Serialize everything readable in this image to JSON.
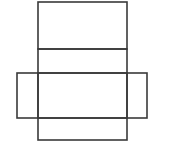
{
  "diagram": {
    "type": "net-of-cuboid",
    "stroke_color": "#3a3a3a",
    "background": "#ffffff",
    "stroke_width": 1.6,
    "faces": [
      {
        "name": "top-face",
        "x": 38,
        "y": 2,
        "w": 89,
        "h": 47
      },
      {
        "name": "back-face",
        "x": 38,
        "y": 49,
        "w": 89,
        "h": 24
      },
      {
        "name": "bottom-face",
        "x": 38,
        "y": 73,
        "w": 89,
        "h": 45
      },
      {
        "name": "front-face",
        "x": 38,
        "y": 118,
        "w": 89,
        "h": 22
      },
      {
        "name": "left-face",
        "x": 17,
        "y": 73,
        "w": 21,
        "h": 45
      },
      {
        "name": "right-face",
        "x": 127,
        "y": 73,
        "w": 20,
        "h": 45
      }
    ]
  }
}
